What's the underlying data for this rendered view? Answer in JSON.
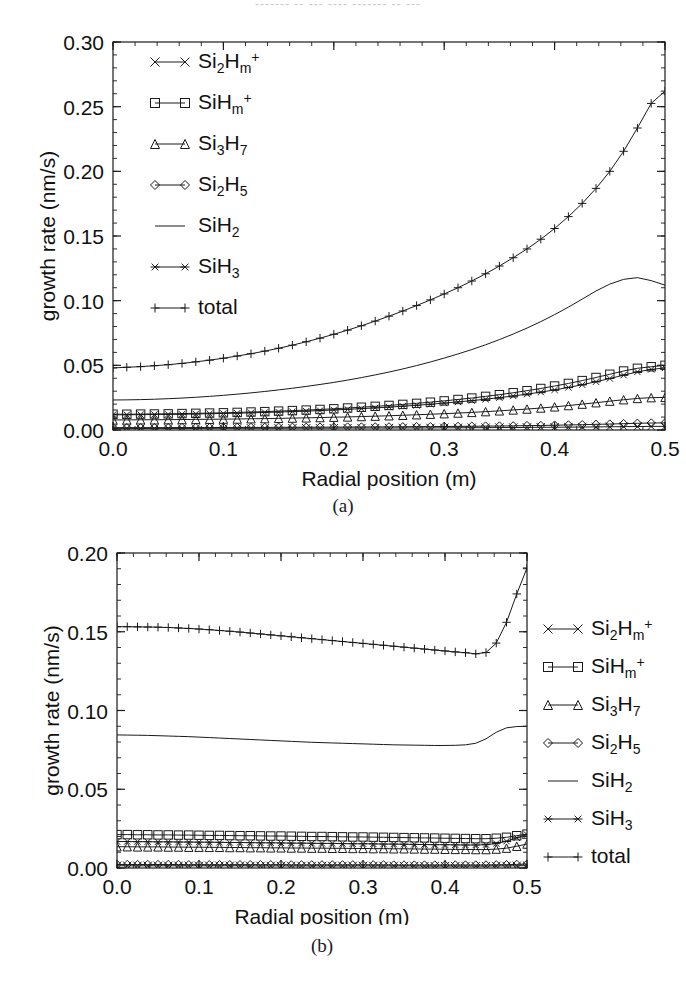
{
  "figure": {
    "top_fragment": "-------  -- --- ---- ------- -- ---",
    "caption_a": "(a)",
    "caption_b": "(b)"
  },
  "chart_data": [
    {
      "id": "panel-a",
      "type": "line",
      "title": "",
      "xlabel": "Radial position (m)",
      "ylabel": "growth rate (nm/s)",
      "xlim": [
        0.0,
        0.5
      ],
      "ylim": [
        0.0,
        0.3
      ],
      "xticks": [
        0.0,
        0.1,
        0.2,
        0.3,
        0.4,
        0.5
      ],
      "xticklabels": [
        "0.0",
        "0.1",
        "0.2",
        "0.3",
        "0.4",
        "0.5"
      ],
      "yticks": [
        0.0,
        0.05,
        0.1,
        0.15,
        0.2,
        0.25,
        0.3
      ],
      "yticklabels": [
        "0.00",
        "0.05",
        "0.10",
        "0.15",
        "0.20",
        "0.25",
        "0.30"
      ],
      "minor_ticks": true,
      "grid": false,
      "legend_position": "upper-left-inside",
      "x": [
        0.0,
        0.0125,
        0.025,
        0.0375,
        0.05,
        0.0625,
        0.075,
        0.0875,
        0.1,
        0.1125,
        0.125,
        0.1375,
        0.15,
        0.1625,
        0.175,
        0.1875,
        0.2,
        0.2125,
        0.225,
        0.2375,
        0.25,
        0.2625,
        0.275,
        0.2875,
        0.3,
        0.3125,
        0.325,
        0.3375,
        0.35,
        0.3625,
        0.375,
        0.3875,
        0.4,
        0.4125,
        0.425,
        0.4375,
        0.45,
        0.4625,
        0.475,
        0.4875,
        0.5
      ],
      "series": [
        {
          "name": "total",
          "marker": "plus",
          "values": [
            0.048,
            0.0485,
            0.049,
            0.0497,
            0.0505,
            0.0515,
            0.0527,
            0.054,
            0.0555,
            0.0572,
            0.059,
            0.061,
            0.0632,
            0.0656,
            0.0682,
            0.071,
            0.074,
            0.0772,
            0.0806,
            0.0842,
            0.088,
            0.092,
            0.0962,
            0.1006,
            0.1052,
            0.11,
            0.1152,
            0.1208,
            0.1268,
            0.1332,
            0.14,
            0.1475,
            0.1558,
            0.165,
            0.1752,
            0.1868,
            0.2,
            0.2155,
            0.2335,
            0.2525,
            0.262
          ]
        },
        {
          "name": "SiH2",
          "marker": "line",
          "values": [
            0.0232,
            0.0233,
            0.0235,
            0.0238,
            0.0242,
            0.0247,
            0.0253,
            0.026,
            0.0268,
            0.0277,
            0.0287,
            0.0298,
            0.031,
            0.0323,
            0.0337,
            0.0352,
            0.0368,
            0.0386,
            0.0405,
            0.0426,
            0.0448,
            0.0472,
            0.0498,
            0.0526,
            0.0556,
            0.0588,
            0.0622,
            0.0659,
            0.0699,
            0.0742,
            0.0788,
            0.0838,
            0.0892,
            0.095,
            0.1012,
            0.1075,
            0.1128,
            0.1165,
            0.1178,
            0.1155,
            0.112
          ]
        },
        {
          "name": "SiH3",
          "marker": "star",
          "values": [
            0.0118,
            0.0118,
            0.0119,
            0.012,
            0.0121,
            0.0122,
            0.0124,
            0.0126,
            0.0128,
            0.013,
            0.0133,
            0.0136,
            0.0139,
            0.0142,
            0.0146,
            0.015,
            0.0155,
            0.016,
            0.0165,
            0.0171,
            0.0177,
            0.0184,
            0.0191,
            0.0199,
            0.0208,
            0.0217,
            0.0227,
            0.0238,
            0.025,
            0.0263,
            0.0277,
            0.0293,
            0.031,
            0.0329,
            0.035,
            0.0373,
            0.0398,
            0.0424,
            0.0449,
            0.0468,
            0.048
          ]
        },
        {
          "name": "SiHm+",
          "marker": "square",
          "values": [
            0.0122,
            0.0122,
            0.0123,
            0.0124,
            0.0125,
            0.0127,
            0.0129,
            0.0131,
            0.0133,
            0.0136,
            0.0139,
            0.0142,
            0.0146,
            0.015,
            0.0154,
            0.0159,
            0.0164,
            0.017,
            0.0176,
            0.0183,
            0.019,
            0.0198,
            0.0206,
            0.0215,
            0.0225,
            0.0236,
            0.0247,
            0.026,
            0.0273,
            0.0288,
            0.0304,
            0.0321,
            0.034,
            0.036,
            0.0382,
            0.0406,
            0.0431,
            0.0456,
            0.0477,
            0.0489,
            0.05
          ]
        },
        {
          "name": "Si3H7",
          "marker": "triangle",
          "values": [
            0.0078,
            0.0078,
            0.0079,
            0.0079,
            0.008,
            0.0081,
            0.0082,
            0.0083,
            0.0084,
            0.0085,
            0.0087,
            0.0088,
            0.009,
            0.0092,
            0.0094,
            0.0096,
            0.0099,
            0.0101,
            0.0104,
            0.0107,
            0.011,
            0.0114,
            0.0118,
            0.0122,
            0.0126,
            0.0131,
            0.0136,
            0.0142,
            0.0148,
            0.0155,
            0.0162,
            0.017,
            0.0179,
            0.0189,
            0.02,
            0.0211,
            0.0223,
            0.0234,
            0.0244,
            0.025,
            0.0252
          ]
        },
        {
          "name": "Si2H5",
          "marker": "diamond",
          "values": [
            0.0018,
            0.0018,
            0.0018,
            0.0018,
            0.0018,
            0.0019,
            0.0019,
            0.0019,
            0.0019,
            0.002,
            0.002,
            0.002,
            0.0021,
            0.0021,
            0.0021,
            0.0022,
            0.0022,
            0.0023,
            0.0023,
            0.0024,
            0.0024,
            0.0025,
            0.0026,
            0.0026,
            0.0027,
            0.0028,
            0.0029,
            0.003,
            0.0031,
            0.0032,
            0.0034,
            0.0035,
            0.0037,
            0.0039,
            0.0041,
            0.0044,
            0.0046,
            0.0049,
            0.0052,
            0.0054,
            0.0055
          ]
        },
        {
          "name": "Si2Hm+",
          "marker": "cross",
          "values": [
            0.0012,
            0.0012,
            0.0012,
            0.0012,
            0.0012,
            0.0012,
            0.0012,
            0.0013,
            0.0013,
            0.0013,
            0.0013,
            0.0013,
            0.0013,
            0.0014,
            0.0014,
            0.0014,
            0.0014,
            0.0015,
            0.0015,
            0.0015,
            0.0015,
            0.0016,
            0.0016,
            0.0016,
            0.0017,
            0.0017,
            0.0018,
            0.0018,
            0.0019,
            0.0019,
            0.002,
            0.0021,
            0.0021,
            0.0022,
            0.0023,
            0.0024,
            0.0025,
            0.0026,
            0.0027,
            0.0028,
            0.0028
          ]
        }
      ],
      "legend": [
        {
          "label_main": "Si",
          "sub1": "2",
          "mid": "H",
          "sub2": "m",
          "sup": "+",
          "name": "Si2Hm+",
          "marker": "cross"
        },
        {
          "label_main": "SiH",
          "sub1": "",
          "mid": "",
          "sub2": "m",
          "sup": "+",
          "name": "SiHm+",
          "marker": "square"
        },
        {
          "label_main": "Si",
          "sub1": "3",
          "mid": "H",
          "sub2": "7",
          "sup": "",
          "name": "Si3H7",
          "marker": "triangle"
        },
        {
          "label_main": "Si",
          "sub1": "2",
          "mid": "H",
          "sub2": "5",
          "sup": "",
          "name": "Si2H5",
          "marker": "diamond"
        },
        {
          "label_main": "SiH",
          "sub1": "",
          "mid": "",
          "sub2": "2",
          "sup": "",
          "name": "SiH2",
          "marker": "line"
        },
        {
          "label_main": "SiH",
          "sub1": "",
          "mid": "",
          "sub2": "3",
          "sup": "",
          "name": "SiH3",
          "marker": "star"
        },
        {
          "label_main": "total",
          "sub1": "",
          "mid": "",
          "sub2": "",
          "sup": "",
          "name": "total",
          "marker": "plus"
        }
      ]
    },
    {
      "id": "panel-b",
      "type": "line",
      "title": "",
      "xlabel": "Radial position (m)",
      "ylabel": "growth rate (nm/s)",
      "xlim": [
        0.0,
        0.5
      ],
      "ylim": [
        0.0,
        0.2
      ],
      "xticks": [
        0.0,
        0.1,
        0.2,
        0.3,
        0.4,
        0.5
      ],
      "xticklabels": [
        "0.0",
        "0.1",
        "0.2",
        "0.3",
        "0.4",
        "0.5"
      ],
      "yticks": [
        0.0,
        0.05,
        0.1,
        0.15,
        0.2
      ],
      "yticklabels": [
        "0.00",
        "0.05",
        "0.10",
        "0.15",
        "0.20"
      ],
      "minor_ticks": true,
      "grid": false,
      "legend_position": "right-outside",
      "x": [
        0.0,
        0.0125,
        0.025,
        0.0375,
        0.05,
        0.0625,
        0.075,
        0.0875,
        0.1,
        0.1125,
        0.125,
        0.1375,
        0.15,
        0.1625,
        0.175,
        0.1875,
        0.2,
        0.2125,
        0.225,
        0.2375,
        0.25,
        0.2625,
        0.275,
        0.2875,
        0.3,
        0.3125,
        0.325,
        0.3375,
        0.35,
        0.3625,
        0.375,
        0.3875,
        0.4,
        0.4125,
        0.425,
        0.4375,
        0.45,
        0.4625,
        0.475,
        0.4875,
        0.5
      ],
      "series": [
        {
          "name": "total",
          "marker": "plus",
          "values": [
            0.1532,
            0.1532,
            0.1531,
            0.153,
            0.1529,
            0.1527,
            0.1524,
            0.1521,
            0.1517,
            0.1513,
            0.1508,
            0.1503,
            0.1498,
            0.1492,
            0.1486,
            0.148,
            0.1474,
            0.1468,
            0.1462,
            0.1456,
            0.145,
            0.1444,
            0.1438,
            0.1432,
            0.1426,
            0.142,
            0.1414,
            0.1408,
            0.1402,
            0.1396,
            0.139,
            0.1384,
            0.1378,
            0.1372,
            0.1367,
            0.136,
            0.1368,
            0.1428,
            0.156,
            0.174,
            0.1905
          ]
        },
        {
          "name": "SiH2",
          "marker": "line",
          "values": [
            0.0845,
            0.0844,
            0.0843,
            0.0842,
            0.084,
            0.0838,
            0.0836,
            0.0834,
            0.0831,
            0.0828,
            0.0825,
            0.0822,
            0.0819,
            0.0816,
            0.0813,
            0.081,
            0.0807,
            0.0804,
            0.0801,
            0.0798,
            0.0796,
            0.0794,
            0.0792,
            0.079,
            0.0788,
            0.0786,
            0.0784,
            0.0782,
            0.0781,
            0.078,
            0.0779,
            0.0778,
            0.0778,
            0.0779,
            0.0782,
            0.0792,
            0.082,
            0.0862,
            0.089,
            0.0898,
            0.09
          ]
        },
        {
          "name": "SiHm+",
          "marker": "square",
          "values": [
            0.0212,
            0.0212,
            0.0211,
            0.0211,
            0.021,
            0.021,
            0.0209,
            0.0209,
            0.0208,
            0.0207,
            0.0207,
            0.0206,
            0.0205,
            0.0205,
            0.0204,
            0.0203,
            0.0203,
            0.0202,
            0.0201,
            0.02,
            0.02,
            0.0199,
            0.0198,
            0.0197,
            0.0197,
            0.0196,
            0.0195,
            0.0194,
            0.0193,
            0.0192,
            0.0191,
            0.019,
            0.0189,
            0.0188,
            0.0187,
            0.0186,
            0.0186,
            0.0189,
            0.0195,
            0.0205,
            0.0215
          ]
        },
        {
          "name": "SiH3",
          "marker": "star",
          "values": [
            0.0168,
            0.0168,
            0.0167,
            0.0167,
            0.0166,
            0.0166,
            0.0165,
            0.0165,
            0.0164,
            0.0164,
            0.0163,
            0.0162,
            0.0162,
            0.0161,
            0.016,
            0.016,
            0.0159,
            0.0158,
            0.0158,
            0.0157,
            0.0156,
            0.0156,
            0.0155,
            0.0154,
            0.0154,
            0.0153,
            0.0152,
            0.0152,
            0.0151,
            0.015,
            0.0149,
            0.0148,
            0.0148,
            0.0147,
            0.0146,
            0.0146,
            0.0148,
            0.0155,
            0.017,
            0.0192,
            0.0212
          ]
        },
        {
          "name": "Si3H7",
          "marker": "triangle",
          "values": [
            0.0135,
            0.0135,
            0.0134,
            0.0134,
            0.0134,
            0.0133,
            0.0133,
            0.0132,
            0.0132,
            0.0131,
            0.0131,
            0.013,
            0.013,
            0.0129,
            0.0129,
            0.0128,
            0.0128,
            0.0127,
            0.0127,
            0.0126,
            0.0126,
            0.0125,
            0.0125,
            0.0124,
            0.0124,
            0.0123,
            0.0123,
            0.0122,
            0.0122,
            0.0121,
            0.012,
            0.012,
            0.0119,
            0.0118,
            0.0118,
            0.0117,
            0.0117,
            0.012,
            0.0126,
            0.0138,
            0.0152
          ]
        },
        {
          "name": "Si2H5",
          "marker": "diamond",
          "values": [
            0.0022,
            0.0022,
            0.0022,
            0.0022,
            0.0022,
            0.0022,
            0.0022,
            0.0021,
            0.0021,
            0.0021,
            0.0021,
            0.0021,
            0.0021,
            0.0021,
            0.0021,
            0.0021,
            0.0021,
            0.002,
            0.002,
            0.002,
            0.002,
            0.002,
            0.002,
            0.002,
            0.002,
            0.002,
            0.002,
            0.0019,
            0.0019,
            0.0019,
            0.0019,
            0.0019,
            0.0019,
            0.0019,
            0.0019,
            0.0019,
            0.0019,
            0.002,
            0.0021,
            0.0023,
            0.0025
          ]
        },
        {
          "name": "Si2Hm+",
          "marker": "cross",
          "values": [
            0.0014,
            0.0014,
            0.0014,
            0.0014,
            0.0014,
            0.0014,
            0.0014,
            0.0014,
            0.0014,
            0.0014,
            0.0014,
            0.0014,
            0.0014,
            0.0013,
            0.0013,
            0.0013,
            0.0013,
            0.0013,
            0.0013,
            0.0013,
            0.0013,
            0.0013,
            0.0013,
            0.0013,
            0.0013,
            0.0013,
            0.0013,
            0.0013,
            0.0013,
            0.0013,
            0.0012,
            0.0012,
            0.0012,
            0.0012,
            0.0012,
            0.0012,
            0.0012,
            0.0013,
            0.0013,
            0.0014,
            0.0015
          ]
        }
      ],
      "legend": [
        {
          "label_main": "Si",
          "sub1": "2",
          "mid": "H",
          "sub2": "m",
          "sup": "+",
          "name": "Si2Hm+",
          "marker": "cross"
        },
        {
          "label_main": "SiH",
          "sub1": "",
          "mid": "",
          "sub2": "m",
          "sup": "+",
          "name": "SiHm+",
          "marker": "square"
        },
        {
          "label_main": "Si",
          "sub1": "3",
          "mid": "H",
          "sub2": "7",
          "sup": "",
          "name": "Si3H7",
          "marker": "triangle"
        },
        {
          "label_main": "Si",
          "sub1": "2",
          "mid": "H",
          "sub2": "5",
          "sup": "",
          "name": "Si2H5",
          "marker": "diamond"
        },
        {
          "label_main": "SiH",
          "sub1": "",
          "mid": "",
          "sub2": "2",
          "sup": "",
          "name": "SiH2",
          "marker": "line"
        },
        {
          "label_main": "SiH",
          "sub1": "",
          "mid": "",
          "sub2": "3",
          "sup": "",
          "name": "SiH3",
          "marker": "star"
        },
        {
          "label_main": "total",
          "sub1": "",
          "mid": "",
          "sub2": "",
          "sup": "",
          "name": "total",
          "marker": "plus"
        }
      ]
    }
  ]
}
